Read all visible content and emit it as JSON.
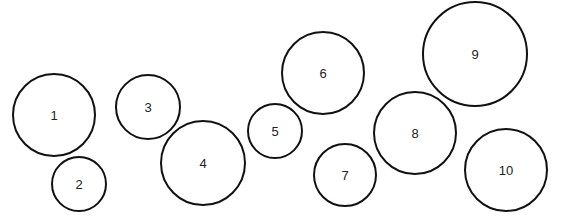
{
  "diagram": {
    "stroke_color": "#111111",
    "label_color": "#222222",
    "background": "#ffffff",
    "circles": [
      {
        "label": "1",
        "cx": 54,
        "cy": 115,
        "r": 42
      },
      {
        "label": "2",
        "cx": 79,
        "cy": 184,
        "r": 28
      },
      {
        "label": "3",
        "cx": 148,
        "cy": 107,
        "r": 33
      },
      {
        "label": "4",
        "cx": 203,
        "cy": 163,
        "r": 43
      },
      {
        "label": "5",
        "cx": 275,
        "cy": 131,
        "r": 28
      },
      {
        "label": "6",
        "cx": 323,
        "cy": 73,
        "r": 42
      },
      {
        "label": "7",
        "cx": 345,
        "cy": 175,
        "r": 32
      },
      {
        "label": "8",
        "cx": 415,
        "cy": 133,
        "r": 42
      },
      {
        "label": "9",
        "cx": 475,
        "cy": 54,
        "r": 53
      },
      {
        "label": "10",
        "cx": 506,
        "cy": 170,
        "r": 42
      }
    ]
  }
}
